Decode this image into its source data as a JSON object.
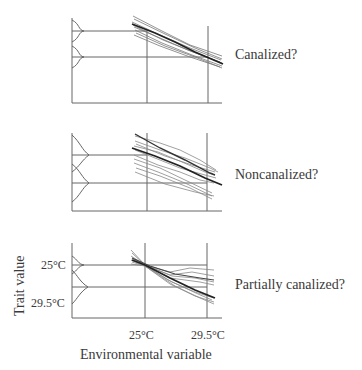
{
  "panels": [
    {
      "id": "canalized",
      "label": "Canalized?"
    },
    {
      "id": "noncanalized",
      "label": "Noncanalized?"
    },
    {
      "id": "partially-canalized",
      "label": "Partially canalized?"
    }
  ],
  "axes": {
    "y_label": "Trait value",
    "x_label": "Environmental variable",
    "y_ticks": [
      "25°C",
      "29.5°C"
    ],
    "x_ticks": [
      "25°C",
      "29.5°C"
    ]
  },
  "colors": {
    "line": "#555555",
    "thick": "#222222",
    "axis": "#666666"
  }
}
